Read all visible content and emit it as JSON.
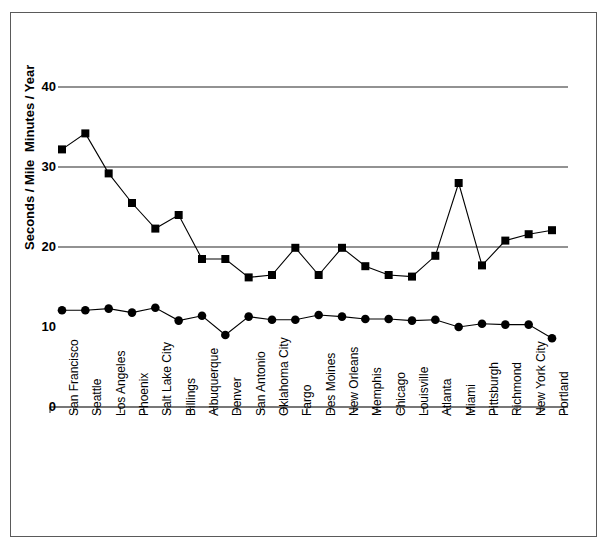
{
  "chart_data": {
    "type": "line",
    "title": "",
    "xlabel": "",
    "ylabel_upper": "Minutes / Year",
    "ylabel_lower": "Seconds / Mile",
    "ylim": [
      0,
      40
    ],
    "yticks": [
      0,
      10,
      20,
      30,
      40
    ],
    "ytick_labels": [
      "0",
      "10",
      "20",
      "30",
      "40"
    ],
    "gridlines": [
      20,
      30,
      40
    ],
    "grid": true,
    "legend": "none",
    "categories": [
      "San Francisco",
      "Seattle",
      "Los Angeles",
      "Phoenix",
      "Salt Lake City",
      "Billings",
      "Albuquerque",
      "Denver",
      "San Antonio",
      "Oklahoma City",
      "Fargo",
      "Des Moines",
      "New Orleans",
      "Memphis",
      "Chicago",
      "Louisville",
      "Atlanta",
      "Miami",
      "Pittsburgh",
      "Richmond",
      "New York City",
      "Portland"
    ],
    "series": [
      {
        "name": "Minutes / Year",
        "marker": "square",
        "color": "#000000",
        "values": [
          32.2,
          34.2,
          29.2,
          25.5,
          22.3,
          24.0,
          18.5,
          18.5,
          16.2,
          16.5,
          19.9,
          16.5,
          19.9,
          17.6,
          16.5,
          16.3,
          18.9,
          28.0,
          17.7,
          20.8,
          21.6,
          22.1
        ]
      },
      {
        "name": "Seconds / Mile",
        "marker": "circle",
        "color": "#000000",
        "values": [
          12.1,
          12.1,
          12.3,
          11.8,
          12.4,
          10.8,
          11.4,
          9.0,
          11.3,
          10.9,
          10.9,
          11.5,
          11.3,
          11.0,
          11.0,
          10.8,
          10.9,
          10.0,
          10.4,
          10.3,
          10.3,
          8.6
        ]
      }
    ]
  },
  "axis_ticks_label": "x-axis-city-ticks"
}
